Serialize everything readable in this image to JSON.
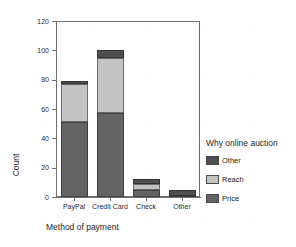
{
  "chart_data": {
    "type": "bar",
    "subtype": "stacked-bar",
    "title": "",
    "xlabel": "Method of payment",
    "ylabel": "Count",
    "categories": [
      "PayPal",
      "Credit Card",
      "Check",
      "Other"
    ],
    "series": [
      {
        "name": "Price",
        "values": [
          51,
          57,
          5,
          1
        ],
        "color": "#646464"
      },
      {
        "name": "Reach",
        "values": [
          26,
          38,
          4,
          0
        ],
        "color": "#c3c3c3"
      },
      {
        "name": "Other",
        "values": [
          2,
          5,
          3,
          4
        ],
        "color": "#4f4f4f"
      }
    ],
    "totals": [
      79,
      100,
      12,
      5
    ],
    "ylim": [
      0,
      120
    ],
    "yticks": [
      0,
      20,
      40,
      60,
      80,
      100,
      120
    ],
    "ytick_labels": [
      "0",
      "20",
      "40",
      "60",
      "80",
      "100",
      "120"
    ],
    "grid": false,
    "legend_position": "right",
    "legend_title": "Why  online auction",
    "legend_entries": [
      "Other",
      "Reach",
      "Price"
    ],
    "stack_order_bottom_to_top": [
      "Price",
      "Reach",
      "Other"
    ]
  },
  "axes": {
    "y_title": "Count",
    "x_title": "Method of payment",
    "y_ticks": [
      {
        "label": "120",
        "value": 120
      },
      {
        "label": "100",
        "value": 100
      },
      {
        "label": "80",
        "value": 80
      },
      {
        "label": "60",
        "value": 60
      },
      {
        "label": "40",
        "value": 40
      },
      {
        "label": "20",
        "value": 20
      },
      {
        "label": "0",
        "value": 0
      }
    ],
    "x_ticks": [
      {
        "label": "PayPal"
      },
      {
        "label": "Credit Card"
      },
      {
        "label": "Check"
      },
      {
        "label": "Other"
      }
    ]
  },
  "legend": {
    "title": "Why  online auction",
    "items": [
      {
        "label": "Other",
        "color": "#4f4f4f"
      },
      {
        "label": "Reach",
        "color": "#c3c3c3"
      },
      {
        "label": "Price",
        "color": "#646464"
      }
    ]
  },
  "colors": {
    "price": "#646464",
    "reach": "#c3c3c3",
    "other": "#4f4f4f",
    "axis": "#707070",
    "frame": "#6e6e6e",
    "background": "#ffffff",
    "text": "#1f1f1f"
  }
}
